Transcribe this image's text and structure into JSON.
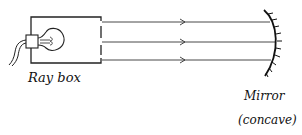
{
  "diagram": {
    "title": "",
    "labels": {
      "ray_box": "Ray box",
      "mirror": "Mirror",
      "mirror_type": "(concave)"
    },
    "components": [
      {
        "name": "ray-box",
        "label": "Ray box"
      },
      {
        "name": "light-bulb"
      },
      {
        "name": "power-cable"
      },
      {
        "name": "concave-mirror",
        "label": "Mirror (concave)"
      }
    ],
    "rays": [
      {
        "id": 1,
        "direction": "right",
        "y": 22
      },
      {
        "id": 2,
        "direction": "right",
        "y": 42
      },
      {
        "id": 3,
        "direction": "right",
        "y": 60
      }
    ],
    "colors": {
      "line": "#222222",
      "background": "#ffffff"
    }
  }
}
